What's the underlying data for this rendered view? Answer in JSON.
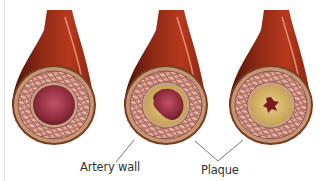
{
  "figure": {
    "panels": [
      {
        "id": "normal",
        "cx": 54,
        "plaque": "none"
      },
      {
        "id": "partial",
        "cx": 166,
        "plaque": "partial"
      },
      {
        "id": "severe",
        "cx": 271,
        "plaque": "severe"
      }
    ],
    "labels": {
      "artery_wall": "Artery wall",
      "plaque": "Plaque"
    },
    "colors": {
      "vessel_dark": "#5e1a0c",
      "vessel_mid": "#a8321a",
      "vessel_light": "#c9452a",
      "highlight": "#e89a7c",
      "wall_outer": "#b58a66",
      "wall_weave": "#e3a793",
      "weave_line": "#6b2a30",
      "lumen": "#9c2f3f",
      "plaque": "#d6b868",
      "leader": "#555555"
    }
  }
}
